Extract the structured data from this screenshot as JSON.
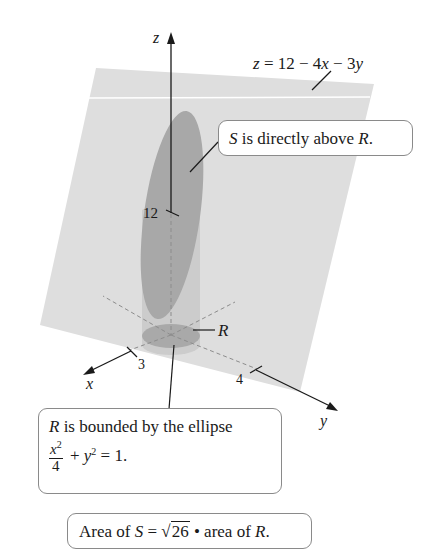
{
  "figure": {
    "plane_equation": {
      "z": "z",
      "eq": " = 12 − 4",
      "x": "x",
      "mid": " − 3",
      "y": "y"
    },
    "axes": {
      "z_label": "z",
      "x_label": "x",
      "y_label": "y",
      "z_intercept": "12",
      "x_intercept": "3",
      "y_intercept": "4"
    },
    "region_label": "R",
    "colors": {
      "plane": "#dcdcdc",
      "surface_S": "#a6a6a6",
      "cylinder": "#c8c8c8",
      "region_R": "#ababab",
      "axis": "#1a1a1a",
      "callout_border": "#8a8a8a"
    }
  },
  "callouts": {
    "surface": {
      "S": "S",
      "text": " is directly above ",
      "R": "R",
      "end": "."
    },
    "region": {
      "R": "R",
      "line1": " is bounded by the ellipse",
      "frac_num": "x",
      "frac_num_exp": "2",
      "frac_den": "4",
      "plus": " + ",
      "y": "y",
      "y_exp": "2",
      "rhs": " = 1."
    },
    "area": {
      "pre": "Area of ",
      "S": "S",
      "eq": " = ",
      "sqrt_sym": "√",
      "radicand": "26",
      "post": " • area of ",
      "R": "R",
      "end": "."
    }
  }
}
